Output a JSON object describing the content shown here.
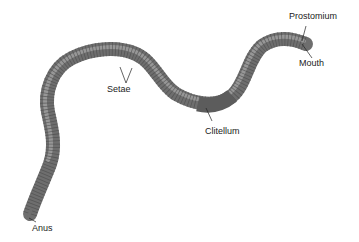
{
  "diagram": {
    "colors": {
      "body": "#7a7a7a",
      "body_highlight": "#b0b0b0",
      "segment_lines": "#4a4a4a",
      "clitellum": "#5a5a5a",
      "leader_lines": "#222222",
      "label_text": "#222222"
    },
    "labels": [
      {
        "id": "prostomium",
        "text": "Prostomium",
        "x": 311,
        "y": 16
      },
      {
        "id": "mouth",
        "text": "Mouth",
        "x": 313,
        "y": 58
      },
      {
        "id": "setae",
        "text": "Setae",
        "x": 107,
        "y": 84
      },
      {
        "id": "clitellum",
        "text": "Clitellum",
        "x": 205,
        "y": 130
      },
      {
        "id": "anus",
        "text": "Anus",
        "x": 32,
        "y": 229
      }
    ]
  }
}
